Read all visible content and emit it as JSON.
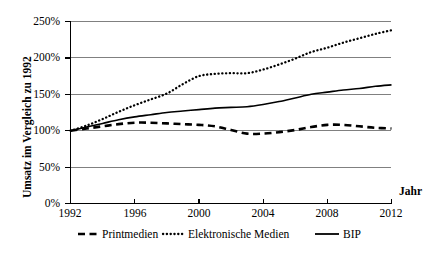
{
  "chart_data": {
    "type": "line",
    "title": "",
    "xlabel": "Jahr",
    "ylabel": "Umsatz im Vergleich zu 1992",
    "xlim": [
      1992,
      2012
    ],
    "ylim": [
      0,
      250
    ],
    "yunit": "%",
    "grid": "horizontal",
    "legend_position": "bottom",
    "xticks": [
      "1992",
      "1996",
      "2000",
      "2004",
      "2008",
      "2012"
    ],
    "xtick_values": [
      1992,
      1996,
      2000,
      2004,
      2008,
      2012
    ],
    "yticks": [
      "0%",
      "50%",
      "100%",
      "150%",
      "200%",
      "250%"
    ],
    "ytick_values": [
      0,
      50,
      100,
      150,
      200,
      250
    ],
    "x": [
      1992,
      1993,
      1994,
      1995,
      1996,
      1997,
      1998,
      1999,
      2000,
      2001,
      2002,
      2003,
      2004,
      2005,
      2006,
      2007,
      2008,
      2009,
      2010,
      2011,
      2012
    ],
    "series": [
      {
        "name": "Printmedien",
        "style": "dashed",
        "color": "#000000",
        "values": [
          100,
          103,
          106,
          109,
          111,
          111,
          110,
          109,
          108,
          106,
          101,
          96,
          96,
          98,
          101,
          105,
          108,
          108,
          106,
          104,
          103
        ]
      },
      {
        "name": "Elektronische Medien",
        "style": "dotted",
        "color": "#000000",
        "values": [
          100,
          107,
          116,
          126,
          135,
          143,
          151,
          164,
          175,
          178,
          179,
          179,
          184,
          191,
          199,
          208,
          214,
          221,
          227,
          233,
          238
        ]
      },
      {
        "name": "BIP",
        "style": "solid",
        "color": "#000000",
        "values": [
          100,
          105,
          110,
          115,
          119,
          122,
          125,
          127,
          129,
          131,
          132,
          133,
          136,
          140,
          145,
          150,
          153,
          156,
          158,
          161,
          163
        ]
      }
    ]
  },
  "axes": {
    "y_title": "Umsatz im Vergleich zu 1992",
    "x_title": "Jahr",
    "ytick_labels": [
      "250%",
      "200%",
      "150%",
      "100%",
      "50%",
      "0%"
    ],
    "xtick_labels": [
      "1992",
      "1996",
      "2000",
      "2004",
      "2008",
      "2012"
    ]
  },
  "legend": {
    "items": [
      {
        "label": "Printmedien",
        "style": "dashed"
      },
      {
        "label": "Elektronische Medien",
        "style": "dotted"
      },
      {
        "label": "BIP",
        "style": "solid"
      }
    ]
  },
  "colors": {
    "ink": "#000000",
    "grid": "#808080",
    "background": "#ffffff"
  }
}
